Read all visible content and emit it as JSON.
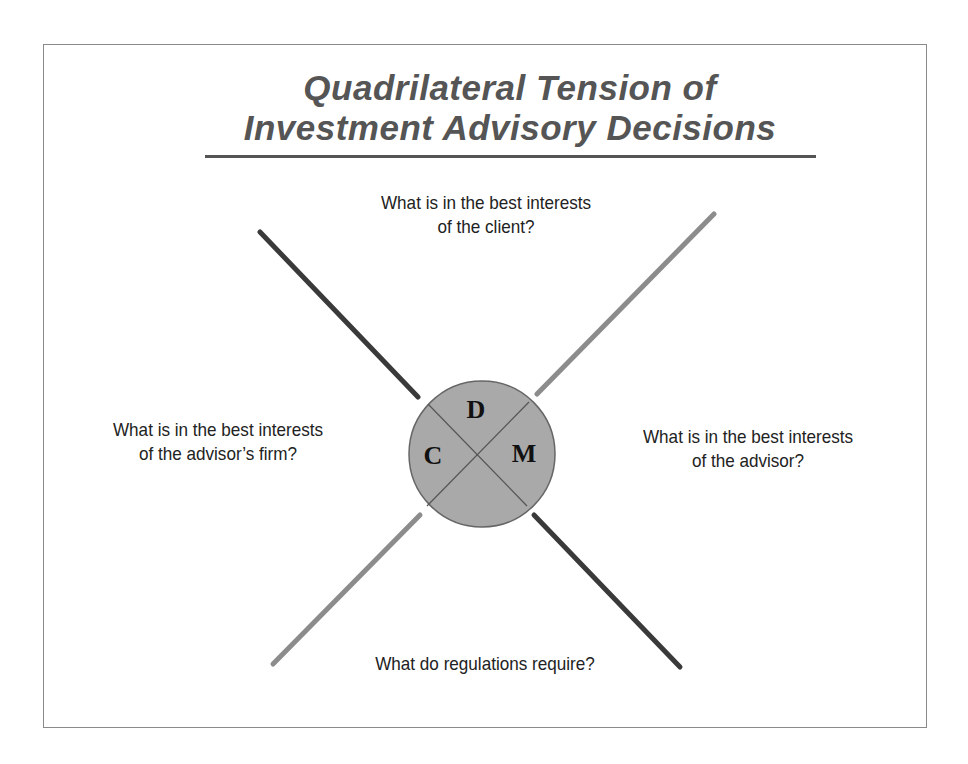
{
  "title": {
    "line1": "Quadrilateral Tension of",
    "line2": "Investment Advisory Decisions"
  },
  "questions": {
    "top": {
      "line1": "What is in the best interests",
      "line2": "of the client?"
    },
    "left": {
      "line1": "What is in the best interests",
      "line2": "of  the advisor’s firm?"
    },
    "right": {
      "line1": "What is in the best interests",
      "line2": "of the advisor?"
    },
    "bottom": {
      "line1": "What do regulations require?"
    }
  },
  "center_circle": {
    "labels": {
      "top": "D",
      "left": "C",
      "right": "M"
    },
    "fill": "#a9a9a9",
    "stroke": "#666666"
  },
  "colors": {
    "dark_line": "#3a3a3a",
    "light_line": "#8c8c8c",
    "title": "#555555",
    "text": "#222222"
  }
}
